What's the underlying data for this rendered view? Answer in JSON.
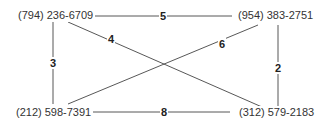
{
  "diagram": {
    "type": "weighted-graph",
    "nodes": [
      {
        "id": "tl",
        "label": "(794) 236-6709"
      },
      {
        "id": "tr",
        "label": "(954) 383-2751"
      },
      {
        "id": "bl",
        "label": "(212) 598-7391"
      },
      {
        "id": "br",
        "label": "(312) 579-2183"
      }
    ],
    "edges": [
      {
        "from": "tl",
        "to": "tr",
        "weight": "5"
      },
      {
        "from": "tl",
        "to": "br",
        "weight": "4"
      },
      {
        "from": "tl",
        "to": "bl",
        "weight": "3"
      },
      {
        "from": "bl",
        "to": "tr",
        "weight": "6"
      },
      {
        "from": "tr",
        "to": "br",
        "weight": "2"
      },
      {
        "from": "bl",
        "to": "br",
        "weight": "8"
      }
    ]
  }
}
